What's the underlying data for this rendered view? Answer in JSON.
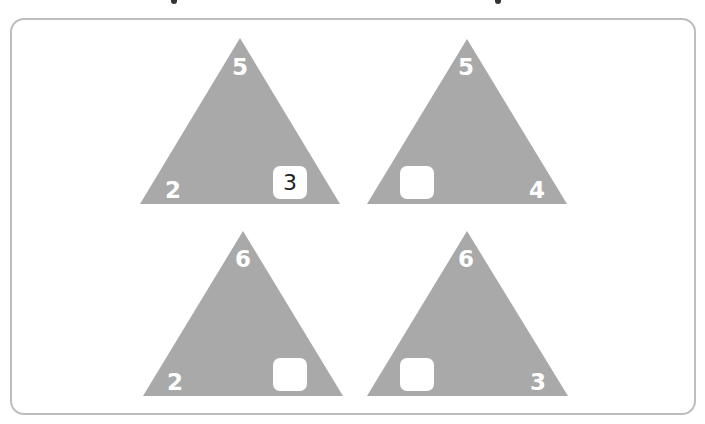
{
  "colors": {
    "triangle": "#a9a9a9",
    "frame_border": "#bdbdbd",
    "number": "#ffffff",
    "answer_box": "#ffffff",
    "answer_text": "#222222"
  },
  "triangles": [
    {
      "top": "5",
      "left": "2",
      "right": "",
      "answer_box": "right",
      "answer": "3"
    },
    {
      "top": "5",
      "left": "",
      "right": "4",
      "answer_box": "left",
      "answer": ""
    },
    {
      "top": "6",
      "left": "2",
      "right": "",
      "answer_box": "right",
      "answer": ""
    },
    {
      "top": "6",
      "left": "",
      "right": "3",
      "answer_box": "left",
      "answer": ""
    }
  ]
}
